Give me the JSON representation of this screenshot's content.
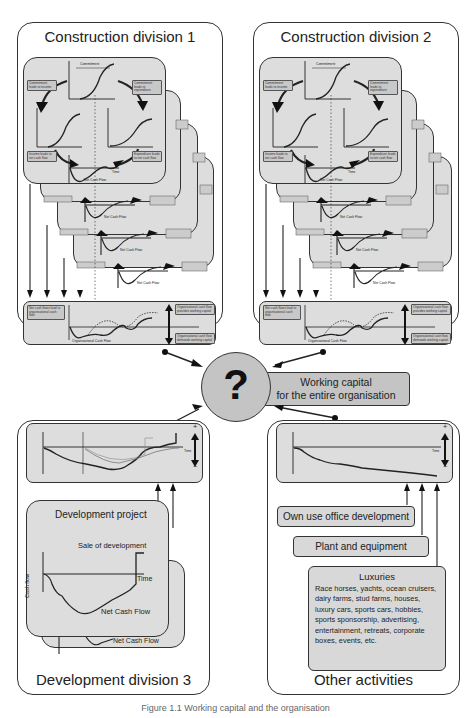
{
  "divisions": {
    "construction_1": {
      "title": "Construction division 1",
      "card_labels": {
        "commitment_income": "Commitment leads to income",
        "commitment_expenditure": "Commitment leads to expenditure",
        "income_ncf": "Income leads to net cash flow",
        "expenditure_ncf": "Expenditure leads to net cash flow",
        "net_cash_flow": "Net Cash Flow",
        "commitment": "Commitment",
        "time": "Time"
      },
      "stacked_card_count": 4,
      "org_strip": {
        "leads_label": "Net cash flows lead to organisational cash flow",
        "provides_label": "Organisational cash flow provides working capital",
        "demands_label": "Organisational cash flow demands working capital",
        "curve_label": "Organisational Cash Flow",
        "time": "Time"
      }
    },
    "construction_2": {
      "title": "Construction division 2",
      "card_labels": {
        "commitment_income": "Commitment leads to income",
        "commitment_expenditure": "Commitment leads to expenditure",
        "income_ncf": "Income leads to net cash flow",
        "expenditure_ncf": "Expenditure leads to net cash flow",
        "net_cash_flow": "Net Cash Flow",
        "commitment": "Commitment",
        "time": "Time"
      },
      "stacked_card_count": 4,
      "org_strip": {
        "leads_label": "Net cash flows lead to organisational cash flow",
        "provides_label": "Organisational cash flow provides working capital",
        "demands_label": "Organisational cash flow demands working capital",
        "curve_label": "Organisational Cash Flow",
        "time": "Time"
      }
    },
    "development_3": {
      "title": "Development division 3",
      "project": {
        "title": "Development project",
        "sale_label": "Sale of development",
        "time_label": "Time",
        "y_label": "Cash flow",
        "curve_label": "Net Cash Flow",
        "back_curve_label": "Net Cash Flow"
      },
      "strip": {
        "plus": "+",
        "minus": "−",
        "time": "Time"
      }
    },
    "other": {
      "title": "Other activities",
      "strip": {
        "plus": "+",
        "minus": "−",
        "time": "Time"
      },
      "items": [
        "Own use office development",
        "Plant and equipment"
      ],
      "luxuries": {
        "title": "Luxuries",
        "text": "Race horses, yachts, ocean cruisers, dairy farms, stud farms, houses, luxury cars, sports cars, hobbies, sports sponsorship, advertising, entertainment, retreats, corporate boxes, events, etc."
      }
    }
  },
  "center": {
    "symbol": "?",
    "label_line1": "Working capital",
    "label_line2": "for the entire organisation"
  },
  "caption": "Figure 1.1 Working capital and the organisation",
  "colors": {
    "panel_fill": "#dddddd",
    "circle_fill": "#c4c4c4",
    "stroke": "#333333"
  }
}
